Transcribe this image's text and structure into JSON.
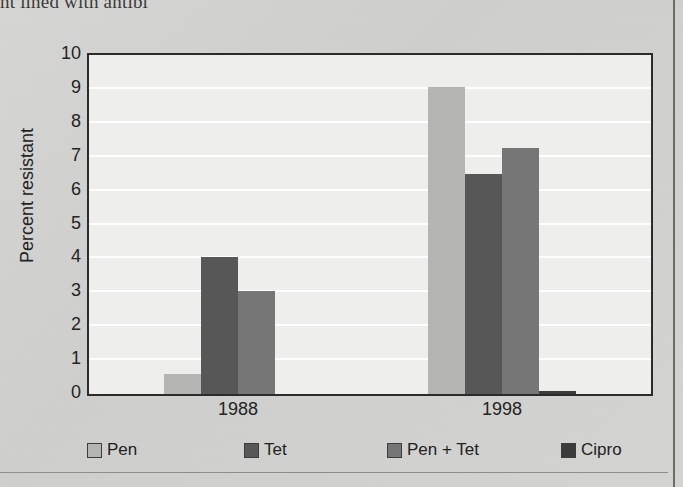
{
  "page": {
    "cut_off_heading": "nt lined with antibi",
    "background_color": "#d2d2d0"
  },
  "chart_data": {
    "type": "bar",
    "title": "",
    "subtitle": "",
    "xlabel": "",
    "ylabel": "Percent resistant",
    "categories": [
      "1988",
      "1998"
    ],
    "series": [
      {
        "name": "Pen",
        "values": [
          0.6,
          9.05
        ],
        "color": "#b4b4b2"
      },
      {
        "name": "Tet",
        "values": [
          4.05,
          6.5
        ],
        "color": "#575757"
      },
      {
        "name": "Pen + Tet",
        "values": [
          3.05,
          7.25
        ],
        "color": "#767676"
      },
      {
        "name": "Cipro",
        "values": [
          0,
          0.1
        ],
        "color": "#3b3b3b"
      }
    ],
    "ylim": [
      0,
      10
    ],
    "yticks": [
      "0",
      "1",
      "2",
      "3",
      "4",
      "5",
      "6",
      "7",
      "8",
      "9",
      "10"
    ],
    "grid": "horizontal-white",
    "legend_position": "bottom",
    "plot_background": "#eeeeec",
    "frame_color": "#2b2b2b"
  }
}
